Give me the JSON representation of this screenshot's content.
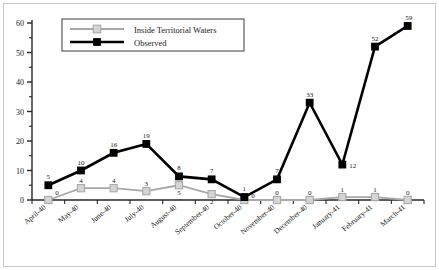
{
  "chart_data": {
    "type": "line",
    "title": "",
    "subtitle": "",
    "xlabel": "",
    "ylabel": "",
    "ylim": [
      0,
      60
    ],
    "yticks": [
      0,
      10,
      20,
      30,
      40,
      50,
      60
    ],
    "grid": false,
    "legend_position": "top-left",
    "categories": [
      "April-40",
      "May-40",
      "June-40",
      "July-40",
      "August-40",
      "September-40",
      "October-40",
      "November-40",
      "December-40",
      "January-41",
      "February-41",
      "March-41"
    ],
    "series": [
      {
        "name": "Inside Territorial Waters",
        "color": "#a8a8a8",
        "marker": "square",
        "marker_fill": "#d4d4d4",
        "values": [
          0,
          4,
          4,
          3,
          5,
          2,
          0,
          0,
          0,
          1,
          1,
          0
        ],
        "labels": [
          "0",
          "4",
          "4",
          "3",
          "5",
          "2",
          "0",
          "0",
          "0",
          "1",
          "1",
          "0"
        ]
      },
      {
        "name": "Observed",
        "color": "#000000",
        "marker": "square",
        "marker_fill": "#000000",
        "values": [
          5,
          10,
          16,
          19,
          8,
          7,
          1,
          7,
          33,
          12,
          52,
          59
        ],
        "labels": [
          "5",
          "10",
          "16",
          "19",
          "8",
          "7",
          "1",
          "7",
          "33",
          "12",
          "52",
          "59"
        ]
      }
    ]
  },
  "legend": {
    "entries": [
      {
        "label": "Inside Territorial Waters"
      },
      {
        "label": "Observed"
      }
    ]
  },
  "axis": {
    "y_tick_labels": [
      "0",
      "10",
      "20",
      "30",
      "40",
      "50",
      "60"
    ],
    "x_tick_labels": [
      "April-40",
      "May-40",
      "June-40",
      "July-40",
      "August-40",
      "September-40",
      "October-40",
      "November-40",
      "December-40",
      "January-41",
      "February-41",
      "March-41"
    ]
  }
}
